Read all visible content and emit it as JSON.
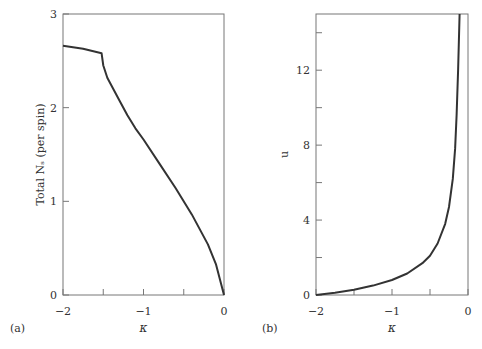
{
  "chart_data": [
    {
      "type": "line",
      "panel_label": "(a)",
      "title": "",
      "xlabel": "κ",
      "ylabel": "Total N_s (per spin)",
      "xlim": [
        -2,
        0
      ],
      "ylim": [
        0,
        3
      ],
      "xticks": [
        -2,
        -1.5,
        -1,
        -0.5,
        0
      ],
      "xtick_labels": [
        "−2",
        "",
        "−1",
        "",
        "0"
      ],
      "yticks": [
        0,
        1,
        2,
        3
      ],
      "ytick_labels": [
        "0",
        "1",
        "2",
        "3"
      ],
      "grid": false,
      "x": [
        -2.0,
        -1.75,
        -1.52,
        -1.5,
        -1.45,
        -1.4,
        -1.3,
        -1.2,
        -1.1,
        -1.0,
        -0.8,
        -0.6,
        -0.4,
        -0.2,
        -0.1,
        0.0
      ],
      "values": [
        2.66,
        2.63,
        2.58,
        2.45,
        2.32,
        2.24,
        2.08,
        1.92,
        1.78,
        1.66,
        1.4,
        1.14,
        0.86,
        0.54,
        0.33,
        0.0
      ]
    },
    {
      "type": "line",
      "panel_label": "(b)",
      "title": "",
      "xlabel": "κ",
      "ylabel": "u",
      "xlim": [
        -2,
        0
      ],
      "ylim": [
        0,
        15
      ],
      "xticks": [
        -2,
        -1.5,
        -1,
        -0.5,
        0
      ],
      "xtick_labels": [
        "−2",
        "",
        "−1",
        "",
        "0"
      ],
      "yticks": [
        0,
        2,
        4,
        6,
        8,
        10,
        12,
        14
      ],
      "ytick_labels": [
        "0",
        "",
        "4",
        "",
        "8",
        "",
        "12",
        ""
      ],
      "grid": false,
      "x": [
        -2.0,
        -1.75,
        -1.5,
        -1.25,
        -1.0,
        -0.8,
        -0.6,
        -0.5,
        -0.4,
        -0.3,
        -0.25,
        -0.2,
        -0.17,
        -0.15,
        -0.13,
        -0.11
      ],
      "values": [
        0.0,
        0.12,
        0.28,
        0.5,
        0.8,
        1.15,
        1.7,
        2.1,
        2.75,
        3.8,
        4.7,
        6.2,
        7.8,
        9.6,
        12.0,
        15.0
      ]
    }
  ]
}
